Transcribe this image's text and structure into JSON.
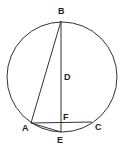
{
  "diagram": {
    "type": "geometry-circle",
    "colors": {
      "stroke": "#333333",
      "label": "#222222",
      "background": "#ffffff"
    },
    "circle": {
      "cx": 62,
      "cy": 77,
      "r": 55
    },
    "points": {
      "A": {
        "x": 31,
        "y": 123,
        "label": "A"
      },
      "B": {
        "x": 61,
        "y": 21,
        "label": "B"
      },
      "C": {
        "x": 92,
        "y": 122,
        "label": "C"
      },
      "D": {
        "x": 61,
        "y": 76,
        "label": "D"
      },
      "E": {
        "x": 61,
        "y": 132,
        "label": "E"
      },
      "F": {
        "x": 61,
        "y": 122,
        "label": "F"
      }
    },
    "segments": [
      {
        "from": "B",
        "to": "E"
      },
      {
        "from": "A",
        "to": "B"
      },
      {
        "from": "A",
        "to": "C"
      },
      {
        "from": "A",
        "to": "E"
      }
    ]
  }
}
